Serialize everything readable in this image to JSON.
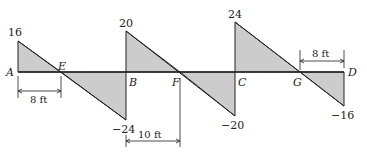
{
  "diagram": {
    "type": "shear-force-diagram",
    "points": [
      {
        "label": "A",
        "x": 18
      },
      {
        "label": "E",
        "x": 61
      },
      {
        "label": "B",
        "x": 126
      },
      {
        "label": "F",
        "x": 180
      },
      {
        "label": "C",
        "x": 235
      },
      {
        "label": "G",
        "x": 300
      },
      {
        "label": "D",
        "x": 344
      }
    ],
    "values": [
      {
        "label": "16",
        "at": "A"
      },
      {
        "label": "−24",
        "at": "B-left"
      },
      {
        "label": "20",
        "at": "B-right"
      },
      {
        "label": "−20",
        "at": "C-left"
      },
      {
        "label": "24",
        "at": "C-right"
      },
      {
        "label": "−16",
        "at": "D"
      }
    ],
    "dimensions": [
      {
        "label": "8 ft",
        "from": "A",
        "to": "E"
      },
      {
        "label": "10 ft",
        "from": "B",
        "to": "F"
      },
      {
        "label": "8 ft",
        "from": "G",
        "to": "D"
      }
    ],
    "fill_color": "#cccccc",
    "line_color": "#222222"
  }
}
